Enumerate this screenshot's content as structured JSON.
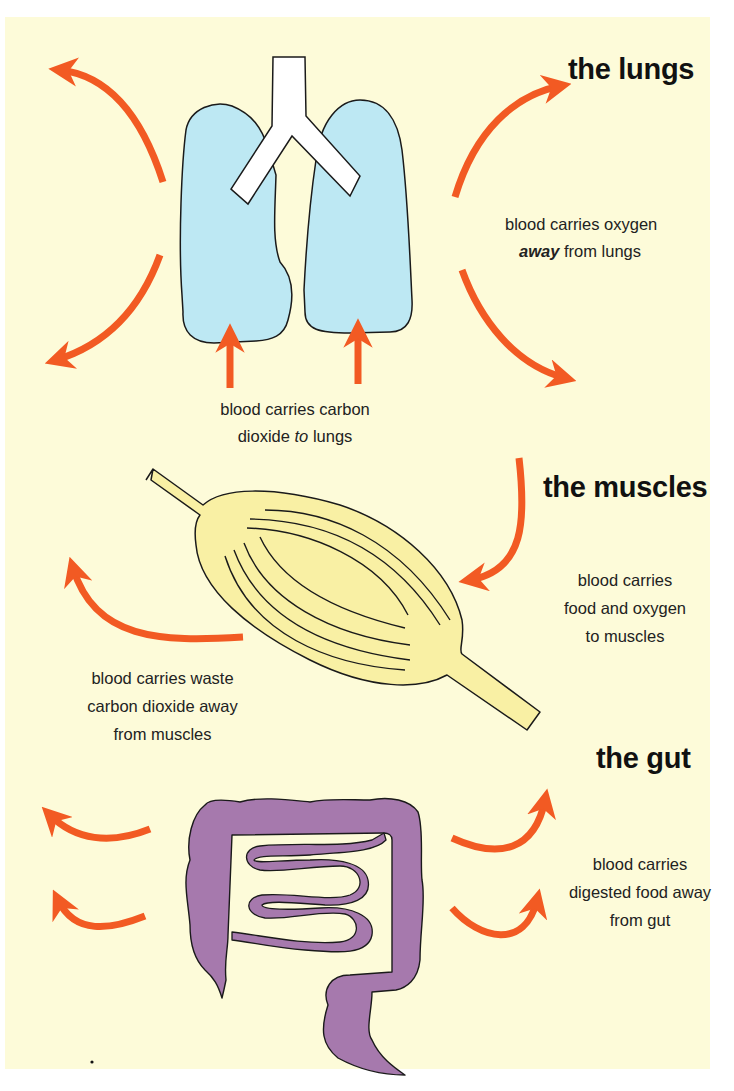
{
  "colors": {
    "background": "#fdfbd9",
    "page_margin": "#ffffff",
    "arrow": "#f25a23",
    "lungs_fill": "#bde8f3",
    "trachea_fill": "#ffffff",
    "muscle_fill": "#f9f0a4",
    "gut_fill": "#a679ad",
    "outline": "#1a1a1a",
    "text": "#222222"
  },
  "sections": {
    "lungs": {
      "title": "the lungs",
      "caption_away": {
        "line1": "blood carries oxygen",
        "line2_emphasis": "away",
        "line2_rest": " from lungs"
      },
      "caption_to": {
        "line1": "blood carries carbon",
        "line2_pre": "dioxide ",
        "line2_emphasis": "to",
        "line2_rest": " lungs"
      }
    },
    "muscles": {
      "title": "the muscles",
      "caption_in": [
        "blood carries",
        "food and  oxygen",
        "to muscles"
      ],
      "caption_out": [
        "blood carries waste",
        "carbon dioxide away",
        "from muscles"
      ]
    },
    "gut": {
      "title": "the gut",
      "caption": [
        "blood carries",
        "digested food away",
        "from gut"
      ]
    }
  },
  "icons": {
    "lungs": "lungs-illustration",
    "muscle": "muscle-illustration",
    "gut": "intestine-illustration",
    "arrow": "curved-arrow"
  }
}
